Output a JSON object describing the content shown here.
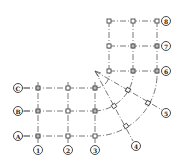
{
  "diagram": {
    "type": "structural-axis-grid",
    "row_axes_left": [
      {
        "label": "C",
        "y": 88
      },
      {
        "label": "B",
        "y": 111
      },
      {
        "label": "A",
        "y": 136
      }
    ],
    "col_axes_bottom": [
      {
        "label": "1",
        "x": 38
      },
      {
        "label": "2",
        "x": 68
      },
      {
        "label": "3",
        "x": 95
      }
    ],
    "row_axes_right": [
      {
        "label": "8",
        "y": 21
      },
      {
        "label": "7",
        "y": 46
      },
      {
        "label": "6",
        "y": 71
      }
    ],
    "radial_axes": [
      {
        "label": "5"
      },
      {
        "label": "4"
      }
    ],
    "caption": ""
  }
}
